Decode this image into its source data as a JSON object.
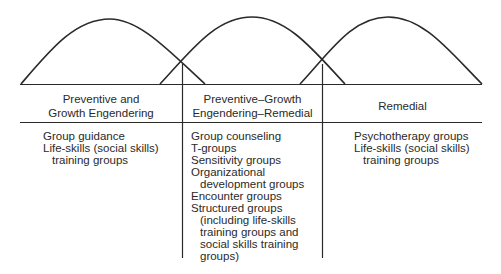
{
  "diagram": {
    "curves": [
      {
        "name": "preventive-growth-curve",
        "start_x": 21,
        "peak_x": 110,
        "end_x": 205
      },
      {
        "name": "middle-curve",
        "start_x": 160,
        "peak_x": 252,
        "end_x": 345
      },
      {
        "name": "remedial-curve",
        "start_x": 300,
        "peak_x": 388,
        "end_x": 482
      }
    ],
    "columns": [
      {
        "header_line1": "Preventive and",
        "header_line2": "Growth Engendering",
        "items": [
          {
            "lines": [
              "Group guidance"
            ]
          },
          {
            "lines": [
              "Life-skills (social skills)",
              "training groups"
            ]
          }
        ]
      },
      {
        "header_line1": "Preventive–Growth",
        "header_line2": "Engendering–Remedial",
        "items": [
          {
            "lines": [
              "Group counseling"
            ]
          },
          {
            "lines": [
              "T-groups"
            ]
          },
          {
            "lines": [
              "Sensitivity groups"
            ]
          },
          {
            "lines": [
              "Organizational",
              "development groups"
            ]
          },
          {
            "lines": [
              "Encounter groups"
            ]
          },
          {
            "lines": [
              "Structured groups",
              "(including life-skills",
              "training groups and",
              "social skills training",
              "groups)"
            ]
          }
        ]
      },
      {
        "header_line1": "Remedial",
        "header_line2": "",
        "items": [
          {
            "lines": [
              "Psychotherapy groups"
            ]
          },
          {
            "lines": [
              "Life-skills (social skills)",
              "training groups"
            ]
          }
        ]
      }
    ],
    "colors": {
      "line": "#2a2a2a",
      "text": "#2a2a2a",
      "background": "#ffffff"
    }
  }
}
